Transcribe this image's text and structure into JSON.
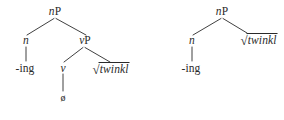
{
  "figure": {
    "kind": "syntactic-tree-pair",
    "ink_color": "#2a2a2a",
    "background_color": "#ffffff"
  },
  "trees": [
    {
      "id": "left",
      "nodes": {
        "root": {
          "head": "n",
          "proj": "P",
          "text": "nP"
        },
        "n_head": {
          "text": "n"
        },
        "vP": {
          "head": "v",
          "proj": "P",
          "text": "vP"
        },
        "ing": {
          "text": "-ing"
        },
        "v_head": {
          "text": "v"
        },
        "sqrt_root": {
          "radical": "√",
          "body": "twinkl",
          "text": "√twinkl"
        },
        "null_morph": {
          "text": "ø"
        }
      }
    },
    {
      "id": "right",
      "nodes": {
        "root": {
          "head": "n",
          "proj": "P",
          "text": "nP"
        },
        "n_head": {
          "text": "n"
        },
        "ing": {
          "text": "-ing"
        },
        "sqrt_root": {
          "radical": "√",
          "body": "twinkl",
          "text": "√twinkl"
        }
      }
    }
  ]
}
